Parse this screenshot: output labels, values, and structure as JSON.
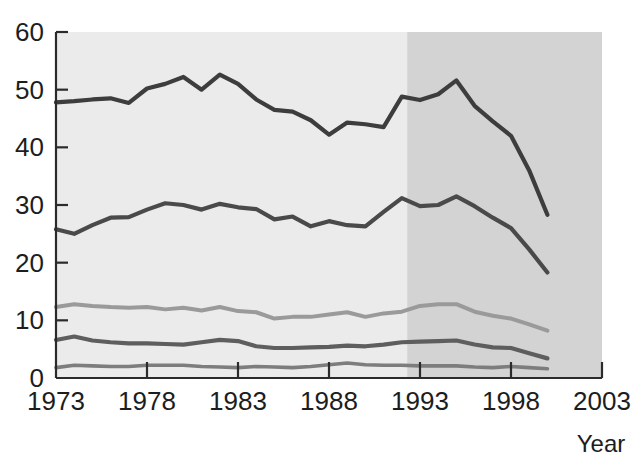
{
  "chart_data": {
    "type": "line",
    "title": "",
    "xlabel": "Year",
    "ylabel": "",
    "xlim": [
      1973,
      2003
    ],
    "ylim": [
      0,
      60
    ],
    "grid": false,
    "legend": "none",
    "x_ticks": [
      "1973",
      "1978",
      "1983",
      "1988",
      "1993",
      "1998",
      "2003"
    ],
    "x_tick_values": [
      1973,
      1978,
      1983,
      1988,
      1993,
      1998,
      2003
    ],
    "y_ticks": [
      "0",
      "10",
      "20",
      "30",
      "40",
      "50",
      "60"
    ],
    "y_tick_values": [
      0,
      10,
      20,
      30,
      40,
      50,
      60
    ],
    "x": [
      1973,
      1974,
      1975,
      1976,
      1977,
      1978,
      1979,
      1980,
      1981,
      1982,
      1983,
      1984,
      1985,
      1986,
      1987,
      1988,
      1989,
      1990,
      1991,
      1992,
      1993,
      1994,
      1995,
      1996,
      1997,
      1998,
      1999,
      2000
    ],
    "shaded_region": {
      "from": 1992.3,
      "to": 2003,
      "color": "#d3d3d3"
    },
    "plot_background": "#ebebeb",
    "series": [
      {
        "name": "series-1",
        "color": "#3d3d3d",
        "linewidth": 4.2,
        "values": [
          47.8,
          48.0,
          48.3,
          48.5,
          47.7,
          50.2,
          51.0,
          52.2,
          50.0,
          52.6,
          51.0,
          48.3,
          46.5,
          46.2,
          44.7,
          42.2,
          44.3,
          44.0,
          43.5,
          48.8,
          48.2,
          49.2,
          51.6,
          47.2,
          44.5,
          42.0,
          36.0,
          28.3
        ]
      },
      {
        "name": "series-2",
        "color": "#4a4a4a",
        "linewidth": 4.2,
        "values": [
          25.8,
          25.0,
          26.5,
          27.8,
          27.9,
          29.2,
          30.3,
          30.0,
          29.2,
          30.2,
          29.6,
          29.3,
          27.5,
          28.0,
          26.3,
          27.2,
          26.5,
          26.3,
          28.8,
          31.2,
          29.8,
          30.0,
          31.5,
          29.8,
          27.8,
          26.0,
          22.3,
          18.3
        ]
      },
      {
        "name": "series-3",
        "color": "#9a9a9a",
        "linewidth": 4.0,
        "values": [
          12.3,
          12.8,
          12.5,
          12.3,
          12.2,
          12.3,
          11.9,
          12.2,
          11.7,
          12.3,
          11.6,
          11.4,
          10.3,
          10.6,
          10.6,
          11.0,
          11.4,
          10.6,
          11.2,
          11.5,
          12.5,
          12.8,
          12.8,
          11.5,
          10.8,
          10.3,
          9.3,
          8.2
        ]
      },
      {
        "name": "series-4",
        "color": "#5e5e5e",
        "linewidth": 4.2,
        "values": [
          6.6,
          7.2,
          6.5,
          6.2,
          6.0,
          6.0,
          5.9,
          5.8,
          6.2,
          6.6,
          6.4,
          5.5,
          5.2,
          5.2,
          5.3,
          5.4,
          5.6,
          5.5,
          5.8,
          6.2,
          6.3,
          6.4,
          6.5,
          5.8,
          5.3,
          5.2,
          4.3,
          3.4
        ]
      },
      {
        "name": "series-5",
        "color": "#7d7d7d",
        "linewidth": 3.6,
        "values": [
          1.8,
          2.2,
          2.1,
          2.0,
          2.0,
          2.2,
          2.2,
          2.2,
          2.0,
          1.9,
          1.8,
          2.0,
          1.9,
          1.8,
          2.0,
          2.3,
          2.6,
          2.3,
          2.2,
          2.2,
          2.1,
          2.1,
          2.1,
          1.9,
          1.8,
          2.0,
          1.8,
          1.6
        ]
      }
    ]
  },
  "axis": {
    "x_title": "Year"
  }
}
